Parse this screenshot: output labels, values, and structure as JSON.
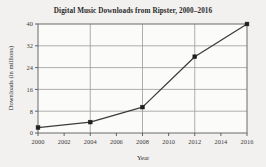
{
  "chart_data": {
    "type": "line",
    "title": "Digital Music Downloads from Ripster, 2000–2016",
    "xlabel": "Year",
    "ylabel": "Downloads (in millions)",
    "x": [
      2000,
      2004,
      2008,
      2012,
      2016
    ],
    "values": [
      2,
      4,
      9.5,
      28,
      40
    ],
    "series": [
      {
        "name": "Digital Music Downloads",
        "values": [
          2,
          4,
          9.5,
          28,
          40
        ]
      }
    ],
    "xlim": [
      2000,
      2016
    ],
    "ylim": [
      0,
      40
    ],
    "x_ticks": [
      2000,
      2002,
      2004,
      2006,
      2008,
      2010,
      2012,
      2014,
      2016
    ],
    "x_tick_labels": [
      "2000",
      "2002",
      "2004",
      "2006",
      "2008",
      "2010",
      "2012",
      "2014",
      "2016"
    ],
    "y_ticks": [
      0,
      8,
      16,
      24,
      32,
      40
    ],
    "y_tick_labels": [
      "0",
      "8",
      "16",
      "24",
      "32",
      "40"
    ],
    "grid": true,
    "grid_x_values": [
      2000,
      2004,
      2008,
      2012,
      2016
    ],
    "grid_y_values": [
      8,
      16,
      24,
      32
    ],
    "legend": null,
    "marker": "square",
    "colors": {
      "background": "#f2f1ef",
      "plot_background": "#fbfbfa",
      "line": "#3c3c3c",
      "marker": "#1f1f1f",
      "grid": "#9a9a9a",
      "axis": "#555555",
      "text": "#2a2a2a"
    }
  }
}
